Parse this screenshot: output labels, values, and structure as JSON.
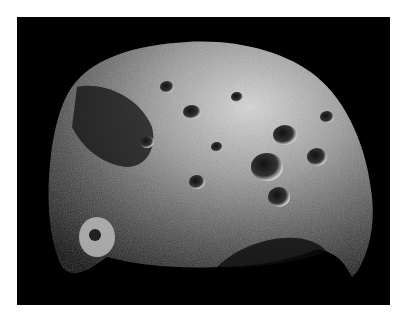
{
  "image": {
    "subject": "Cratered irregular moon (asteroid-like body) against black space",
    "background_color": "#000000",
    "border_color": "#ffffff"
  }
}
